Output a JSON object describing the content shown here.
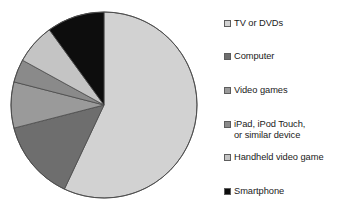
{
  "chart_data": {
    "type": "pie",
    "title": "",
    "subtitle": "",
    "categories": [
      "TV or DVDs",
      "Computer",
      "Video games",
      "iPad, iPod Touch,\nor similar device",
      "Handheld video game",
      "Smartphone"
    ],
    "values": [
      57,
      14,
      8,
      4,
      7,
      10
    ],
    "unit": "percent",
    "colors": [
      "#d2d2d2",
      "#6e6e6e",
      "#9a9a9a",
      "#8a8a8a",
      "#c4c4c4",
      "#0d0d0d"
    ],
    "start_angle_deg": 0,
    "direction": "clockwise",
    "legend_position": "right",
    "grid": false,
    "xlabel": "",
    "ylabel": "",
    "data_labels_shown": false
  },
  "legend": {
    "items": [
      {
        "label": "TV or DVDs",
        "color": "#d2d2d2",
        "swatch_name": "legend-swatch-tv-or-dvds"
      },
      {
        "label": "Computer",
        "color": "#6e6e6e",
        "swatch_name": "legend-swatch-computer"
      },
      {
        "label": "Video games",
        "color": "#9a9a9a",
        "swatch_name": "legend-swatch-video-games"
      },
      {
        "label": "iPad, iPod Touch,\nor similar device",
        "color": "#8a8a8a",
        "swatch_name": "legend-swatch-ipad"
      },
      {
        "label": "Handheld video game",
        "color": "#c4c4c4",
        "swatch_name": "legend-swatch-handheld-video-game"
      },
      {
        "label": "Smartphone",
        "color": "#0d0d0d",
        "swatch_name": "legend-swatch-smartphone"
      }
    ]
  },
  "pie": {
    "center_x": 104,
    "center_y": 105,
    "radius": 93,
    "stroke": "#4a4a4a"
  }
}
